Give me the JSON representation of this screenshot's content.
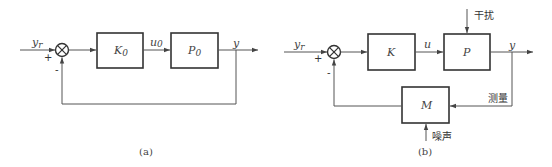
{
  "diagram_a": {
    "caption": "(a)",
    "input_label": "y",
    "input_sub": "r",
    "plus_sign": "+",
    "minus_sign": "-",
    "controller_label": "K",
    "controller_sub": "0",
    "signal_label": "u",
    "signal_sub": "0",
    "plant_label": "P",
    "plant_sub": "0",
    "output_label": "y"
  },
  "diagram_b": {
    "caption": "(b)",
    "input_label": "y",
    "input_sub": "r",
    "plus_sign": "+",
    "minus_sign": "-",
    "controller_label": "K",
    "signal_label": "u",
    "plant_label": "P",
    "output_label": "y",
    "disturbance_label": "干扰",
    "measurement_label": "测量",
    "sensor_label": "M",
    "noise_label": "噪声"
  }
}
